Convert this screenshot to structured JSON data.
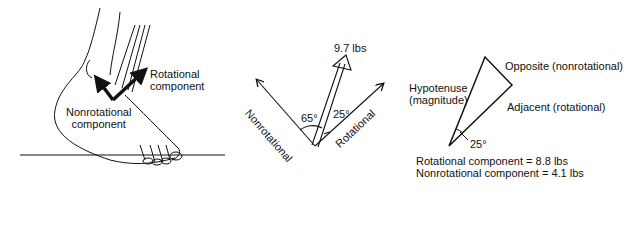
{
  "panel_foot": {
    "rotational_label_1": "Rotational",
    "rotational_label_2": "component",
    "nonrotational_label_1": "Nonrotational",
    "nonrotational_label_2": "component"
  },
  "panel_vectors": {
    "force_label": "9.7 lbs",
    "angle_left": "65°",
    "angle_right": "25°",
    "axis_left": "Nonrotational",
    "axis_right": "Rotational"
  },
  "panel_triangle": {
    "opposite": "Opposite (nonrotational)",
    "hypotenuse_1": "Hypotenuse",
    "hypotenuse_2": "(magnitude)",
    "adjacent": "Adjacent (rotational)",
    "angle": "25°",
    "result_rotational": "Rotational component = 8.8 lbs",
    "result_nonrotational": "Nonrotational component = 4.1 lbs"
  },
  "colors": {
    "ink": "#111111",
    "background": "#ffffff"
  }
}
